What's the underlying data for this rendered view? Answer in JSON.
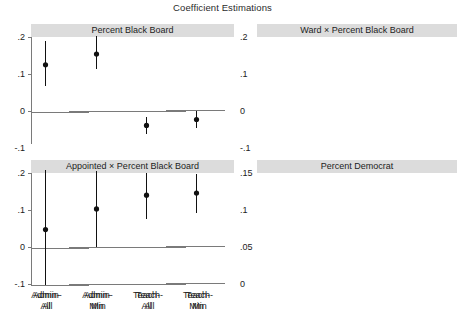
{
  "chart_data": {
    "type": "scatter",
    "title": "Coefficient Estimations",
    "subtitle": "",
    "xlabel": "",
    "ylabel": "",
    "grid": false,
    "legend": "none",
    "layout": "2x2 small-multiples with gray panel header strips",
    "categories": [
      "Admin-All",
      "Admin-Min",
      "Teach-All",
      "Teach-Min"
    ],
    "category_lines": [
      [
        "Admin-",
        "All"
      ],
      [
        "Admin-",
        "Min"
      ],
      [
        "Teach-",
        "All"
      ],
      [
        "Teach-",
        "Min"
      ]
    ],
    "marker": "filled-circle-with-error-bars",
    "panels": [
      {
        "id": "percent-black-board",
        "title": "Percent Black Board",
        "ylim": [
          -0.1,
          0.2
        ],
        "yticks": [
          0.2,
          0.1,
          0,
          -0.1
        ],
        "ytick_labels": [
          ".2",
          ".1",
          "0",
          "-.1"
        ],
        "reference_line": 0,
        "estimates": [
          0.125,
          0.154,
          -0.039,
          -0.023
        ],
        "ci_low": [
          0.068,
          0.113,
          -0.062,
          -0.046
        ],
        "ci_high": [
          0.19,
          0.203,
          -0.015,
          -0.001
        ]
      },
      {
        "id": "ward-x-percent-black-board",
        "title": "Ward × Percent Black Board",
        "ylim": [
          -0.1,
          0.2
        ],
        "yticks": [
          0.2,
          0.1,
          0,
          -0.1
        ],
        "ytick_labels": [
          ".2",
          ".1",
          "0",
          "-.1"
        ],
        "reference_line": 0,
        "estimates": [
          0.045,
          0.0,
          0.146,
          0.112
        ],
        "ci_low": [
          -0.028,
          -0.074,
          0.094,
          0.073
        ],
        "ci_high": [
          0.112,
          0.069,
          0.194,
          0.152
        ]
      },
      {
        "id": "appointed-x-percent-black-board",
        "title": "Appointed × Percent Black Board",
        "ylim": [
          -0.1,
          0.2
        ],
        "yticks": [
          0.2,
          0.1,
          0,
          -0.1
        ],
        "ytick_labels": [
          ".2",
          ".1",
          "0",
          "-.1"
        ],
        "reference_line": 0,
        "estimates": [
          0.047,
          0.103,
          0.14,
          0.146
        ],
        "ci_low": [
          -0.102,
          0.0,
          0.075,
          0.092
        ],
        "ci_high": [
          0.209,
          0.205,
          0.2,
          0.198
        ]
      },
      {
        "id": "percent-democrat",
        "title": "Percent Democrat",
        "ylim": [
          0,
          0.15
        ],
        "yticks": [
          0.15,
          0.1,
          0.05,
          0
        ],
        "ytick_labels": [
          ".15",
          ".1",
          ".05",
          "0"
        ],
        "reference_line": 0.05,
        "estimates": [
          0.125,
          0.112,
          0.043,
          0.035
        ],
        "ci_low": [
          0.093,
          0.086,
          0.027,
          0.022
        ],
        "ci_high": [
          0.146,
          0.135,
          0.059,
          0.049
        ]
      }
    ]
  },
  "style": {
    "header_bg": "#dcdcdc",
    "axis_color": "#7a7a7a",
    "marker_color": "#111111",
    "text_color": "#1c1c1c",
    "background": "#ffffff"
  }
}
